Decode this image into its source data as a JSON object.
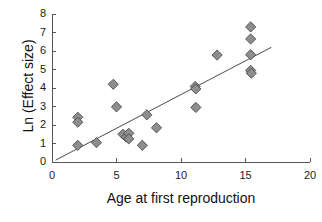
{
  "chart_data": {
    "type": "scatter",
    "title": "",
    "xlabel": "Age at first reproduction",
    "ylabel": "Ln (Effect size)",
    "xlim": [
      0,
      20
    ],
    "ylim": [
      0,
      8
    ],
    "xticks": [
      0,
      5,
      10,
      15,
      20
    ],
    "yticks": [
      0,
      1,
      2,
      3,
      4,
      5,
      6,
      7,
      8
    ],
    "xtick_labels": [
      "0",
      "5",
      "10",
      "15",
      "20"
    ],
    "ytick_labels": [
      "0",
      "1",
      "2",
      "3",
      "4",
      "5",
      "6",
      "7",
      "8"
    ],
    "grid": false,
    "legend": null,
    "marker": {
      "shape": "diamond",
      "fill_color": "#8e8e8e",
      "edge_color": "#4a4a4a",
      "size_px": 8
    },
    "trendline": {
      "visible": true,
      "color": "#4a4a4a",
      "x_start": 0.28,
      "y_start": 0.1,
      "x_end": 17.0,
      "y_end": 6.2
    },
    "points": [
      {
        "x": 2.0,
        "y": 2.42
      },
      {
        "x": 2.0,
        "y": 2.15
      },
      {
        "x": 2.0,
        "y": 0.9
      },
      {
        "x": 3.45,
        "y": 1.05
      },
      {
        "x": 4.75,
        "y": 4.2
      },
      {
        "x": 5.0,
        "y": 2.98
      },
      {
        "x": 5.5,
        "y": 1.5
      },
      {
        "x": 5.75,
        "y": 1.35
      },
      {
        "x": 5.95,
        "y": 1.55
      },
      {
        "x": 5.95,
        "y": 1.25
      },
      {
        "x": 7.0,
        "y": 0.9
      },
      {
        "x": 7.35,
        "y": 2.55
      },
      {
        "x": 8.1,
        "y": 1.85
      },
      {
        "x": 11.1,
        "y": 4.08
      },
      {
        "x": 11.15,
        "y": 3.95
      },
      {
        "x": 11.15,
        "y": 2.95
      },
      {
        "x": 12.8,
        "y": 5.78
      },
      {
        "x": 15.4,
        "y": 7.3
      },
      {
        "x": 15.4,
        "y": 6.65
      },
      {
        "x": 15.4,
        "y": 5.8
      },
      {
        "x": 15.4,
        "y": 4.95
      },
      {
        "x": 15.45,
        "y": 4.8
      }
    ]
  },
  "axes": {
    "x_axis_name": "x-axis",
    "y_axis_name": "y-axis"
  }
}
